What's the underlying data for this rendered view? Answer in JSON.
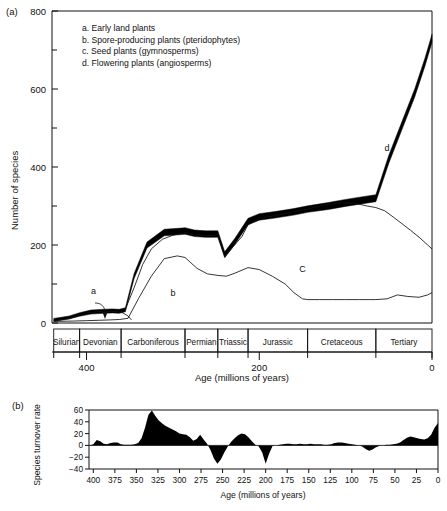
{
  "panel_a": {
    "label": "(a)",
    "ylabel": "Number of species",
    "xlabel": "Age (millions of years)",
    "yticks": [
      "0",
      "200",
      "400",
      "600",
      "800"
    ],
    "xticks": [
      "400",
      "200",
      "0"
    ],
    "legend": [
      "a. Early land plants",
      "b. Spore-producing plants (pteridophytes)",
      "c. Seed plants (gymnosperms)",
      "d. Flowering plants (angiosperms)"
    ],
    "curve_labels": [
      "a",
      "b",
      "C",
      "d"
    ],
    "periods": [
      "Silurian",
      "Devonian",
      "Carboniferous",
      "Permian",
      "Triassic",
      "Jurassic",
      "Cretaceous",
      "Tertiary"
    ]
  },
  "panel_b": {
    "label": "(b)",
    "ylabel": "Species turnover rate",
    "xlabel": "Age (millions of years)",
    "yticks": [
      "60",
      "40",
      "20",
      "0",
      "−20",
      "−40"
    ],
    "xticks": [
      "400",
      "375",
      "350",
      "325",
      "300",
      "275",
      "250",
      "225",
      "200",
      "175",
      "150",
      "125",
      "100",
      "75",
      "50",
      "25",
      "0"
    ]
  },
  "chart_data": [
    {
      "type": "line",
      "title": "",
      "xlabel": "Age (millions of years)",
      "ylabel": "Number of species",
      "xlim": [
        440,
        0
      ],
      "ylim": [
        0,
        800
      ],
      "xticks": [
        400,
        200,
        0
      ],
      "yticks": [
        0,
        200,
        400,
        600,
        800
      ],
      "yminor": [
        100,
        300,
        500,
        700
      ],
      "grid": false,
      "legend_position": "upper-left-inside",
      "axis_direction": "x-reversed",
      "period_bands": [
        {
          "name": "Silurian",
          "start": 438,
          "end": 408
        },
        {
          "name": "Devonian",
          "start": 408,
          "end": 360
        },
        {
          "name": "Carboniferous",
          "start": 360,
          "end": 286
        },
        {
          "name": "Permian",
          "start": 286,
          "end": 248
        },
        {
          "name": "Triassic",
          "start": 248,
          "end": 213
        },
        {
          "name": "Jurassic",
          "start": 213,
          "end": 144
        },
        {
          "name": "Cretaceous",
          "start": 144,
          "end": 65
        },
        {
          "name": "Tertiary",
          "start": 65,
          "end": 0
        }
      ],
      "series": [
        {
          "name": "total (thick band)",
          "style": "thick-band",
          "x": [
            438,
            420,
            408,
            395,
            380,
            370,
            362,
            355,
            345,
            330,
            310,
            290,
            286,
            275,
            262,
            252,
            248,
            240,
            228,
            213,
            200,
            180,
            160,
            144,
            120,
            100,
            80,
            65,
            50,
            35,
            20,
            8,
            0
          ],
          "y": [
            8,
            14,
            22,
            28,
            30,
            31,
            30,
            34,
            120,
            200,
            232,
            235,
            236,
            230,
            228,
            228,
            228,
            175,
            210,
            260,
            272,
            278,
            285,
            292,
            300,
            308,
            315,
            320,
            420,
            505,
            590,
            670,
            730
          ],
          "width": [
            3,
            3,
            3.5,
            4,
            4,
            4,
            4,
            4,
            5,
            6,
            6.5,
            6.5,
            6.5,
            6.5,
            6.5,
            6.5,
            6.5,
            6,
            6,
            6.5,
            6.5,
            6.5,
            6.5,
            6.5,
            7,
            7,
            7,
            7,
            8,
            8,
            8,
            8,
            8
          ]
        },
        {
          "name": "b - spore-producing plants (pteridophytes)",
          "style": "thin",
          "x": [
            438,
            415,
            400,
            385,
            372,
            362,
            352,
            340,
            325,
            310,
            295,
            286,
            272,
            260,
            248,
            238,
            228,
            213,
            200,
            185,
            170,
            160,
            150,
            144,
            130,
            115,
            100,
            85,
            72,
            65,
            52,
            40,
            28,
            15,
            5,
            0
          ],
          "y": [
            4,
            5,
            6,
            7,
            8,
            9,
            12,
            62,
            120,
            165,
            172,
            168,
            140,
            126,
            122,
            120,
            128,
            142,
            137,
            120,
            100,
            78,
            62,
            60,
            60,
            60,
            60,
            60,
            60,
            60,
            62,
            72,
            68,
            66,
            72,
            78
          ]
        },
        {
          "name": "c - seed plants (gymnosperms)",
          "style": "thin",
          "x": [
            355,
            345,
            335,
            325,
            312,
            300,
            290,
            286,
            275,
            262,
            252,
            248,
            240,
            230,
            220,
            213,
            200,
            185,
            170,
            155,
            144,
            130,
            118,
            105,
            95,
            85,
            75,
            65,
            55,
            45,
            35,
            25,
            15,
            5,
            0
          ],
          "y": [
            36,
            90,
            150,
            190,
            215,
            225,
            230,
            232,
            226,
            224,
            225,
            226,
            170,
            196,
            222,
            252,
            268,
            274,
            280,
            288,
            292,
            300,
            305,
            308,
            308,
            305,
            300,
            296,
            288,
            272,
            255,
            238,
            220,
            200,
            190
          ]
        },
        {
          "name": "a - early land plants",
          "style": "thin",
          "x": [
            438,
            420,
            408,
            398,
            388,
            378,
            370,
            364,
            358,
            352,
            348
          ],
          "y": [
            6,
            12,
            20,
            26,
            29,
            30,
            30,
            29,
            26,
            18,
            8
          ]
        }
      ],
      "annotations": [
        {
          "text": "a",
          "x": 392,
          "y": 75
        },
        {
          "text": "b",
          "x": 300,
          "y": 70
        },
        {
          "text": "C",
          "x": 150,
          "y": 130
        },
        {
          "text": "d",
          "x": 52,
          "y": 440
        }
      ]
    },
    {
      "type": "area",
      "title": "",
      "xlabel": "Age (millions of years)",
      "ylabel": "Species turnover rate",
      "xlim": [
        405,
        0
      ],
      "ylim": [
        -40,
        60
      ],
      "xticks": [
        400,
        375,
        350,
        325,
        300,
        275,
        250,
        225,
        200,
        175,
        150,
        125,
        100,
        75,
        50,
        25,
        0
      ],
      "yticks": [
        -40,
        -20,
        0,
        20,
        40,
        60
      ],
      "grid": false,
      "baseline": 0,
      "series": [
        {
          "name": "species turnover rate",
          "fill": "#000000",
          "x": [
            405,
            400,
            396,
            392,
            388,
            384,
            380,
            376,
            372,
            368,
            364,
            360,
            356,
            352,
            348,
            344,
            340,
            336,
            332,
            328,
            324,
            320,
            316,
            312,
            308,
            304,
            300,
            296,
            292,
            288,
            284,
            280,
            276,
            272,
            268,
            264,
            260,
            256,
            252,
            248,
            244,
            240,
            236,
            232,
            228,
            224,
            220,
            216,
            212,
            208,
            204,
            200,
            196,
            192,
            188,
            184,
            180,
            176,
            172,
            168,
            164,
            160,
            156,
            152,
            148,
            144,
            140,
            136,
            132,
            128,
            124,
            120,
            116,
            112,
            108,
            104,
            100,
            96,
            92,
            88,
            84,
            80,
            76,
            72,
            68,
            64,
            60,
            56,
            52,
            48,
            44,
            40,
            36,
            32,
            28,
            24,
            20,
            16,
            12,
            8,
            4,
            0
          ],
          "y": [
            0,
            2,
            9,
            7,
            3,
            2,
            4,
            5,
            5,
            2,
            1,
            1,
            1,
            2,
            4,
            12,
            30,
            52,
            59,
            50,
            42,
            37,
            33,
            30,
            27,
            24,
            20,
            19,
            18,
            14,
            8,
            11,
            18,
            10,
            3,
            -8,
            -22,
            -31,
            -24,
            -12,
            -2,
            6,
            12,
            17,
            20,
            19,
            14,
            7,
            1,
            -2,
            -12,
            -31,
            -14,
            -1,
            0,
            1,
            2,
            3,
            3,
            2,
            2,
            3,
            2,
            2,
            3,
            2,
            2,
            2,
            1,
            1,
            2,
            4,
            5,
            5,
            4,
            3,
            2,
            1,
            0,
            -2,
            -6,
            -9,
            -7,
            -3,
            -1,
            0,
            1,
            1,
            2,
            3,
            5,
            9,
            13,
            15,
            14,
            12,
            11,
            10,
            12,
            18,
            30,
            38,
            39,
            30,
            16,
            6,
            5,
            18,
            24,
            20,
            12,
            6,
            3,
            8,
            12,
            6,
            2,
            5
          ]
        }
      ]
    }
  ],
  "caption": {
    "partial_text": ""
  }
}
